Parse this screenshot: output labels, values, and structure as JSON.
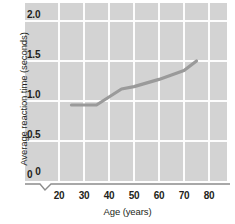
{
  "chart_data": {
    "type": "line",
    "title": "",
    "xlabel": "Age (years)",
    "ylabel": "Average reaction time (seconds)",
    "xlim": [
      20,
      85
    ],
    "ylim": [
      0,
      2.0
    ],
    "x_ticks": [
      20,
      30,
      40,
      50,
      60,
      70,
      80
    ],
    "x_tick_labels": [
      "20",
      "30",
      "40",
      "50",
      "60",
      "70",
      "80"
    ],
    "y_ticks": [
      0,
      0.5,
      1.0,
      1.5,
      2.0
    ],
    "y_tick_labels": [
      "0",
      "0.5",
      "1.0",
      "1.5",
      "2.0"
    ],
    "grid": true,
    "grid_color": "#fdfdfd",
    "plot_background": "#d3d3d3",
    "axis_break": true,
    "axis_break_note": "zigzag break on x-axis between 0 and 20",
    "legend": null,
    "series": [
      {
        "name": "Average reaction time",
        "color": "#9a9a9a",
        "x": [
          25,
          35,
          45,
          50,
          60,
          70,
          75
        ],
        "values": [
          0.95,
          0.95,
          1.15,
          1.18,
          1.27,
          1.38,
          1.5
        ]
      }
    ]
  },
  "axis": {
    "y_title": "Average reaction time (seconds)",
    "x_title": "Age (years)",
    "zero_label": "0"
  }
}
